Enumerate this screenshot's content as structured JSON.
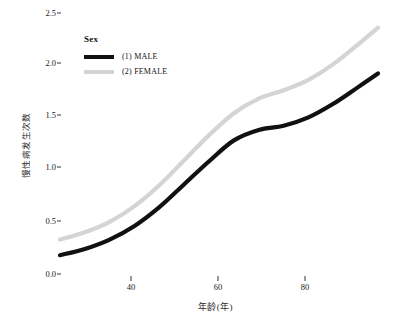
{
  "chart_data": {
    "type": "line",
    "title": "",
    "xlabel": "年龄(年)",
    "ylabel": "慢性病发生次数",
    "xlim": [
      28,
      92
    ],
    "ylim": [
      0.0,
      2.6
    ],
    "grid": false,
    "legend_position": "upper-left-inside",
    "legend_title": "Sex",
    "xticks": [
      40,
      60,
      80
    ],
    "xtick_labels": [
      "40",
      "60",
      "80"
    ],
    "yticks": [
      0.0,
      0.5,
      1.0,
      1.5,
      2.0,
      2.5
    ],
    "ytick_labels": [
      "0.0",
      "0.5",
      "1.0",
      "1.5",
      "2.0",
      "2.5"
    ],
    "x": [
      28,
      33,
      38,
      43,
      48,
      53,
      58,
      63,
      68,
      73,
      78,
      83,
      88,
      92
    ],
    "series": [
      {
        "name": "(1) MALE",
        "color": "#111111",
        "values": [
          0.18,
          0.24,
          0.33,
          0.46,
          0.64,
          0.86,
          1.08,
          1.28,
          1.38,
          1.42,
          1.5,
          1.63,
          1.79,
          1.92
        ]
      },
      {
        "name": "(2) FEMALE",
        "color": "#d4d4d4",
        "values": [
          0.33,
          0.4,
          0.5,
          0.65,
          0.85,
          1.09,
          1.33,
          1.54,
          1.68,
          1.76,
          1.86,
          2.01,
          2.2,
          2.36
        ]
      }
    ]
  },
  "legend": {
    "title": "Sex",
    "entries": [
      {
        "label": "(1) MALE",
        "color": "#111111"
      },
      {
        "label": "(2) FEMALE",
        "color": "#d4d4d4"
      }
    ]
  },
  "axes": {
    "y_label": "慢性病发生次数",
    "x_label": "年龄(年)",
    "y_ticks": [
      "2.5",
      "2.0",
      "1.5",
      "1.0",
      "0.5",
      "0.0"
    ],
    "x_ticks": [
      "40",
      "60",
      "80"
    ]
  }
}
